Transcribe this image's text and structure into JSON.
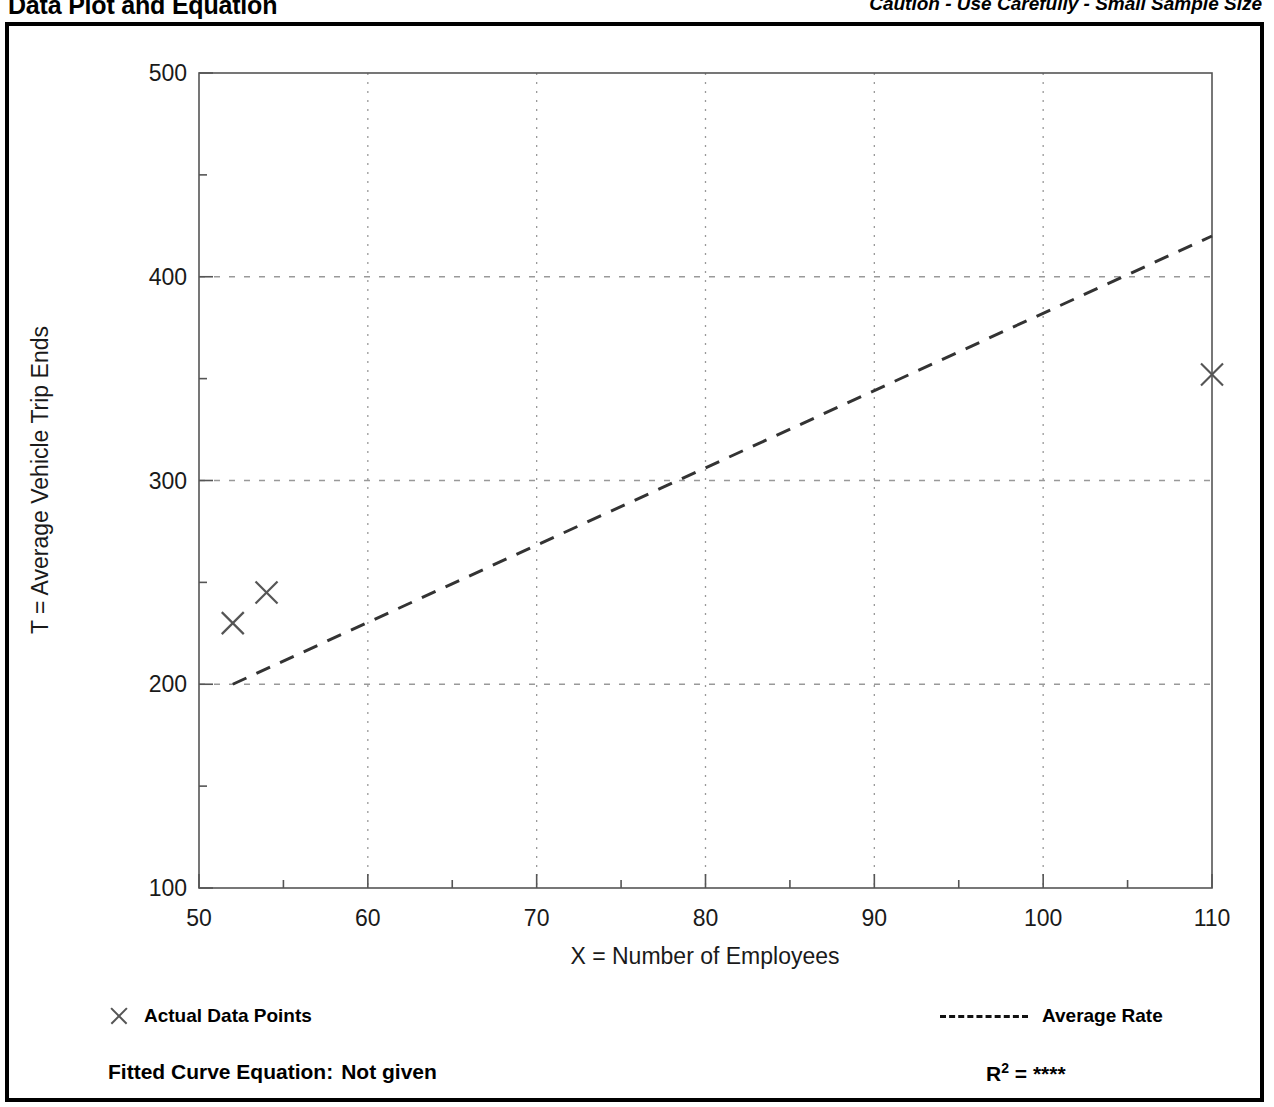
{
  "header": {
    "title": "Data Plot and Equation",
    "caution": "Caution - Use Carefully - Small Sample Size"
  },
  "legend": {
    "data_points_label": "Actual Data Points",
    "average_rate_label": "Average Rate",
    "marker_icon": "x-mark-icon",
    "line_icon": "dashed-line-icon"
  },
  "footer": {
    "fitted_curve_label": "Fitted Curve Equation:",
    "fitted_curve_value": "Not given",
    "r_squared_label": "R",
    "r_squared_exponent": "2",
    "r_squared_equals": "=",
    "r_squared_value": "****"
  },
  "colors": {
    "frame": "#000000",
    "axis": "#555555",
    "grid": "#999999",
    "marker": "#555555",
    "trend_line": "#333333",
    "text": "#000000",
    "background": "#ffffff"
  },
  "chart_data": {
    "type": "scatter",
    "title": "Data Plot and Equation",
    "subtitle": "Caution - Use Carefully - Small Sample Size",
    "xlabel": "X = Number of Employees",
    "ylabel": "T = Average Vehicle Trip Ends",
    "xlim": [
      50,
      110
    ],
    "ylim": [
      100,
      500
    ],
    "xticks": [
      50,
      60,
      70,
      80,
      90,
      100,
      110
    ],
    "yticks": [
      100,
      200,
      300,
      400,
      500
    ],
    "x_minor_ticks": [
      55,
      65,
      75,
      85,
      95,
      105
    ],
    "y_minor_ticks": [
      150,
      250,
      350,
      450
    ],
    "xtick_labels": [
      "50",
      "60",
      "70",
      "80",
      "90",
      "100",
      "110"
    ],
    "ytick_labels": [
      "100",
      "200",
      "300",
      "400",
      "500"
    ],
    "grid": true,
    "grid_style": "dotted",
    "grid_x_values": [
      60,
      70,
      80,
      90,
      100
    ],
    "grid_y_values": [
      200,
      300,
      400
    ],
    "legend_position": "below-plot",
    "series": [
      {
        "name": "Actual Data Points",
        "type": "scatter",
        "marker": "x",
        "points": [
          {
            "x": 52,
            "y": 230
          },
          {
            "x": 54,
            "y": 245
          },
          {
            "x": 110,
            "y": 352
          }
        ]
      },
      {
        "name": "Average Rate",
        "type": "line",
        "style": "dashed",
        "points": [
          {
            "x": 52,
            "y": 200
          },
          {
            "x": 110,
            "y": 420
          }
        ]
      }
    ],
    "fitted_curve_equation": "Not given",
    "r_squared": "****"
  }
}
